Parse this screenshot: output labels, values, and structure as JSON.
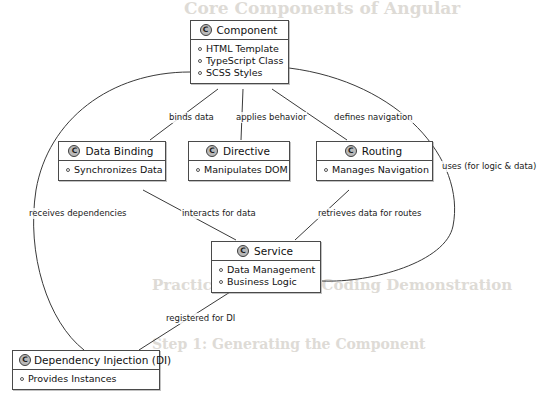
{
  "diagram": {
    "kind": "uml-class-diagram",
    "stereotype_glyph": "C",
    "nodes": [
      {
        "id": "component",
        "title": "Component",
        "attributes": [
          "HTML Template",
          "TypeScript Class",
          "SCSS Styles"
        ]
      },
      {
        "id": "data-binding",
        "title": "Data Binding",
        "attributes": [
          "Synchronizes Data"
        ]
      },
      {
        "id": "directive",
        "title": "Directive",
        "attributes": [
          "Manipulates DOM"
        ]
      },
      {
        "id": "routing",
        "title": "Routing",
        "attributes": [
          "Manages Navigation"
        ]
      },
      {
        "id": "service",
        "title": "Service",
        "attributes": [
          "Data Management",
          "Business Logic"
        ]
      },
      {
        "id": "dependency-injection",
        "title": "Dependency Injection (DI)",
        "attributes": [
          "Provides Instances"
        ]
      }
    ],
    "edges": [
      {
        "id": "binds-data",
        "label": "binds data",
        "from": "component",
        "to": "data-binding"
      },
      {
        "id": "applies-behavior",
        "label": "applies behavior",
        "from": "component",
        "to": "directive"
      },
      {
        "id": "defines-navigation",
        "label": "defines navigation",
        "from": "component",
        "to": "routing"
      },
      {
        "id": "uses-for-logic-data",
        "label": "uses (for logic & data)",
        "from": "component",
        "to": "service"
      },
      {
        "id": "receives-dependencies",
        "label": "receives dependencies",
        "from": "component",
        "to": "dependency-injection"
      },
      {
        "id": "interacts-for-data",
        "label": "interacts for data",
        "from": "data-binding",
        "to": "service"
      },
      {
        "id": "retrieves-data-for-routes",
        "label": "retrieves data for routes",
        "from": "routing",
        "to": "service"
      },
      {
        "id": "registered-for-di",
        "label": "registered for DI",
        "from": "service",
        "to": "dependency-injection"
      }
    ]
  },
  "background_text": {
    "heading_top": "Core Components of Angular",
    "heading_mid": "Practical Hands-On Coding Demonstration",
    "subheading": "Step 1: Generating the Component"
  },
  "colors": {
    "line": "#3a3a3a",
    "node_border": "#4a4a4a",
    "stereotype_fill": "#b9b9b9",
    "page_background": "#ffffff",
    "ghost_text": "#ddd9d4"
  }
}
